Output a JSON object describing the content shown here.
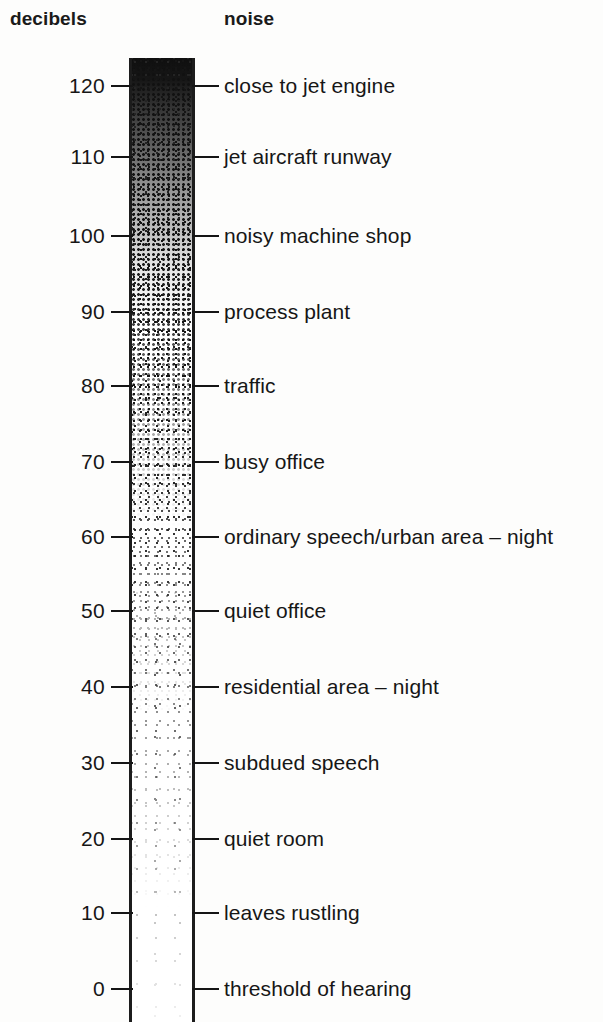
{
  "headers": {
    "decibels": "decibels",
    "noise": "noise"
  },
  "colors": {
    "ink": "#151515",
    "background": "#fdfdfc",
    "column_border": "#1c1c1c"
  },
  "chart_data": {
    "type": "bar",
    "title": "",
    "subtitle": "",
    "xlabel": "noise",
    "ylabel": "decibels",
    "ylim": [
      0,
      125
    ],
    "grid": false,
    "legend": null,
    "orientation": "vertical",
    "categories": [
      "close to jet engine",
      "jet aircraft runway",
      "noisy machine shop",
      "process plant",
      "traffic",
      "busy office",
      "ordinary speech/urban area – night",
      "quiet office",
      "residential area – night",
      "subdued speech",
      "quiet room",
      "leaves rustling",
      "threshold of hearing"
    ],
    "values": [
      120,
      110,
      100,
      90,
      80,
      70,
      60,
      50,
      40,
      30,
      20,
      10,
      0
    ],
    "tick_labels": [
      "120",
      "110",
      "100",
      "90",
      "80",
      "70",
      "60",
      "50",
      "40",
      "30",
      "20",
      "10",
      "0"
    ],
    "points": [
      {
        "db": "120",
        "label": "close to jet engine",
        "y": 86
      },
      {
        "db": "110",
        "label": "jet aircraft runway",
        "y": 157
      },
      {
        "db": "100",
        "label": "noisy machine shop",
        "y": 236
      },
      {
        "db": "90",
        "label": "process plant",
        "y": 312
      },
      {
        "db": "80",
        "label": "traffic",
        "y": 386
      },
      {
        "db": "70",
        "label": "busy office",
        "y": 462
      },
      {
        "db": "60",
        "label": "ordinary speech/urban area – night",
        "y": 537
      },
      {
        "db": "50",
        "label": "quiet office",
        "y": 611
      },
      {
        "db": "40",
        "label": "residential area – night",
        "y": 687
      },
      {
        "db": "30",
        "label": "subdued speech",
        "y": 763
      },
      {
        "db": "20",
        "label": "quiet room",
        "y": 839
      },
      {
        "db": "10",
        "label": "leaves rustling",
        "y": 913
      },
      {
        "db": "0",
        "label": "threshold of hearing",
        "y": 989
      }
    ]
  }
}
